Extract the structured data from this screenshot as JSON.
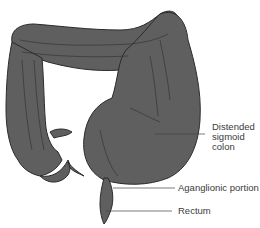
{
  "figure": {
    "colors": {
      "organ_fill": "#5f5f5f",
      "organ_outline": "#2b2b2b",
      "fold_lines": "#2e2e2e",
      "leader_lines": "#444444",
      "label_text": "#3a3a3a",
      "background": "#ffffff"
    },
    "labels": [
      {
        "id": "distended-sigmoid-colon",
        "text": "Distended\nsigmoid\ncolon"
      },
      {
        "id": "aganglionic-portion",
        "text": "Aganglionic portion"
      },
      {
        "id": "rectum",
        "text": "Rectum"
      }
    ]
  }
}
